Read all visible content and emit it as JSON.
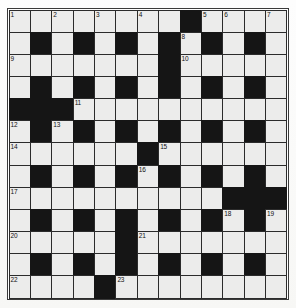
{
  "puzzle": {
    "title": "Crossword Grid",
    "type": "crossword",
    "rows": 13,
    "cols": 13,
    "colors": {
      "block": "#151515",
      "light": "#ececeb",
      "border": "#2b2b2b",
      "frame": "#3a3a3a",
      "paper": "#fdfdfd",
      "number_text": "#111111"
    },
    "grid": [
      [
        "W",
        "W",
        "W",
        "W",
        "W",
        "W",
        "W",
        "W",
        "B",
        "W",
        "W",
        "W",
        "W"
      ],
      [
        "W",
        "B",
        "W",
        "B",
        "W",
        "B",
        "W",
        "B",
        "W",
        "B",
        "W",
        "B",
        "W"
      ],
      [
        "W",
        "W",
        "W",
        "W",
        "W",
        "W",
        "W",
        "B",
        "W",
        "W",
        "W",
        "W",
        "W"
      ],
      [
        "W",
        "B",
        "W",
        "B",
        "W",
        "B",
        "W",
        "B",
        "W",
        "B",
        "W",
        "B",
        "W"
      ],
      [
        "B",
        "B",
        "B",
        "W",
        "W",
        "W",
        "W",
        "W",
        "W",
        "W",
        "W",
        "W",
        "W"
      ],
      [
        "W",
        "B",
        "W",
        "B",
        "W",
        "B",
        "W",
        "B",
        "W",
        "B",
        "W",
        "B",
        "W"
      ],
      [
        "W",
        "W",
        "W",
        "W",
        "W",
        "W",
        "B",
        "W",
        "W",
        "W",
        "W",
        "W",
        "W"
      ],
      [
        "W",
        "B",
        "W",
        "B",
        "W",
        "B",
        "W",
        "B",
        "W",
        "B",
        "W",
        "B",
        "W"
      ],
      [
        "W",
        "W",
        "W",
        "W",
        "W",
        "W",
        "W",
        "W",
        "W",
        "W",
        "B",
        "B",
        "B"
      ],
      [
        "W",
        "B",
        "W",
        "B",
        "W",
        "B",
        "W",
        "B",
        "W",
        "B",
        "W",
        "B",
        "W"
      ],
      [
        "W",
        "W",
        "W",
        "W",
        "W",
        "B",
        "W",
        "W",
        "W",
        "W",
        "W",
        "W",
        "W"
      ],
      [
        "W",
        "B",
        "W",
        "B",
        "W",
        "B",
        "W",
        "B",
        "W",
        "B",
        "W",
        "B",
        "W"
      ],
      [
        "W",
        "W",
        "W",
        "W",
        "B",
        "W",
        "W",
        "W",
        "W",
        "W",
        "W",
        "W",
        "W"
      ]
    ],
    "numbers": [
      {
        "row": 0,
        "col": 0,
        "n": "1"
      },
      {
        "row": 0,
        "col": 2,
        "n": "2"
      },
      {
        "row": 0,
        "col": 4,
        "n": "3"
      },
      {
        "row": 0,
        "col": 6,
        "n": "4"
      },
      {
        "row": 0,
        "col": 9,
        "n": "5"
      },
      {
        "row": 0,
        "col": 10,
        "n": "6"
      },
      {
        "row": 0,
        "col": 12,
        "n": "7"
      },
      {
        "row": 1,
        "col": 8,
        "n": "8"
      },
      {
        "row": 2,
        "col": 0,
        "n": "9"
      },
      {
        "row": 2,
        "col": 8,
        "n": "10"
      },
      {
        "row": 4,
        "col": 3,
        "n": "11"
      },
      {
        "row": 5,
        "col": 0,
        "n": "12"
      },
      {
        "row": 5,
        "col": 2,
        "n": "13"
      },
      {
        "row": 6,
        "col": 0,
        "n": "14"
      },
      {
        "row": 6,
        "col": 7,
        "n": "15"
      },
      {
        "row": 7,
        "col": 6,
        "n": "16"
      },
      {
        "row": 8,
        "col": 0,
        "n": "17"
      },
      {
        "row": 9,
        "col": 10,
        "n": "18"
      },
      {
        "row": 9,
        "col": 12,
        "n": "19"
      },
      {
        "row": 10,
        "col": 0,
        "n": "20"
      },
      {
        "row": 10,
        "col": 6,
        "n": "21"
      },
      {
        "row": 12,
        "col": 0,
        "n": "22"
      },
      {
        "row": 12,
        "col": 5,
        "n": "23"
      }
    ]
  }
}
